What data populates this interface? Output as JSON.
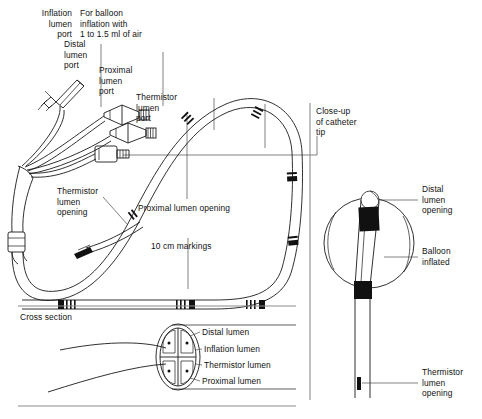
{
  "figure": {
    "background": "#ffffff",
    "ink": "#000000"
  },
  "main_panel": {
    "labels": {
      "inflation_lumen_port": "Inflation\nlumen\nport",
      "balloon_inflation_note": "For balloon\ninflation with\n1 to 1.5 ml of air",
      "distal_lumen_port": "Distal\nlumen\nport",
      "proximal_lumen_port": "Proximal\nlumen\nport",
      "thermistor_lumen_port": "Thermistor\nlumen\nport",
      "thermistor_lumen_opening": "Thermistor\nlumen\nopening",
      "proximal_lumen_opening": "Proximal lumen opening",
      "ten_cm_markings": "10 cm markings"
    }
  },
  "closeup_panel": {
    "caption": "Close-up\nof catheter\ntip",
    "labels": {
      "distal_lumen_opening": "Distal\nlumen\nopening",
      "balloon_inflated": "Balloon\ninflated",
      "thermistor_lumen_opening": "Thermistor\nlumen\nopening"
    }
  },
  "cross_section_panel": {
    "caption": "Cross section",
    "lumens": [
      {
        "name": "Distal lumen"
      },
      {
        "name": "Inflation lumen"
      },
      {
        "name": "Thermistor lumen"
      },
      {
        "name": "Proximal lumen"
      }
    ]
  }
}
